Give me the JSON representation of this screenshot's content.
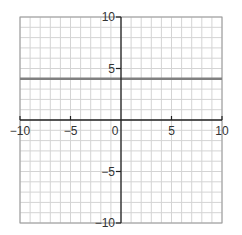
{
  "chart_data": {
    "type": "line",
    "title": "",
    "xlabel": "",
    "ylabel": "",
    "xlim": [
      -10,
      10
    ],
    "ylim": [
      -10,
      10
    ],
    "grid": true,
    "grid_step": 1,
    "x_ticks": [
      -10,
      -5,
      0,
      5,
      10
    ],
    "y_ticks": [
      -10,
      -5,
      5,
      10
    ],
    "x_tick_labels": [
      "−10",
      "−5",
      "0",
      "5",
      "10"
    ],
    "y_tick_labels": [
      "−10",
      "−5",
      "5",
      "10"
    ],
    "series": [
      {
        "name": "y = 4",
        "x": [
          -10,
          10
        ],
        "y": [
          4,
          4
        ],
        "color": "#808080"
      }
    ]
  },
  "colors": {
    "grid": "#d4d4d4",
    "axis": "#222222",
    "frame": "#9a9a9a",
    "line": "#808080"
  }
}
